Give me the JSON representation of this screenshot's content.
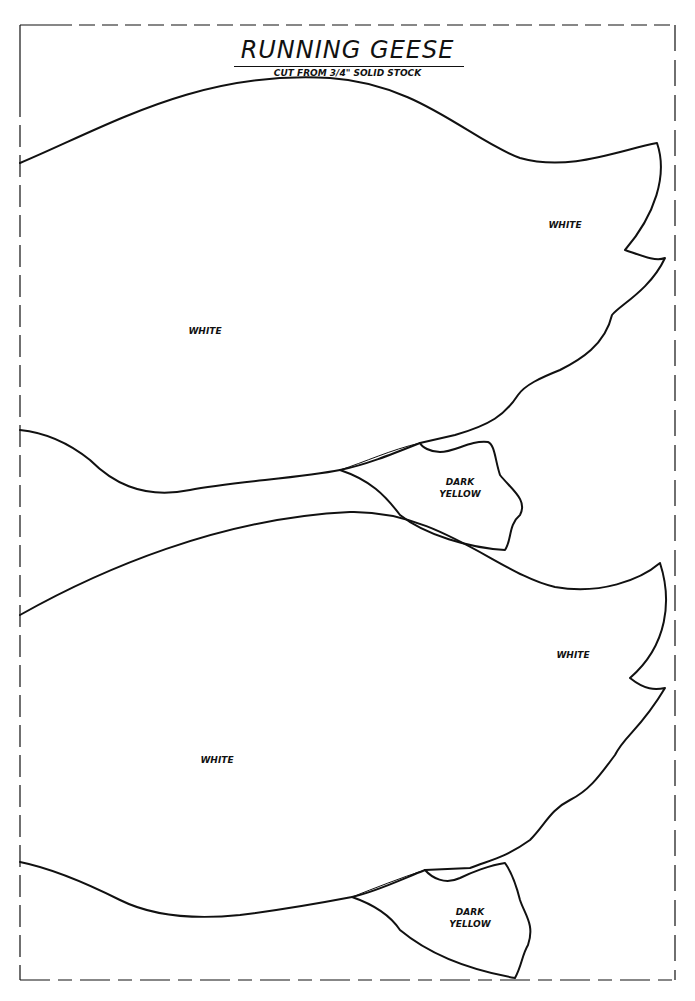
{
  "pattern": {
    "title": "RUNNING GEESE",
    "subtitle": "CUT FROM 3/4\" SOLID STOCK"
  },
  "geese": [
    {
      "body_label": "WHITE",
      "wing_label": "WHITE",
      "feet_label_line1": "DARK",
      "feet_label_line2": "YELLOW"
    },
    {
      "body_label": "WHITE",
      "wing_label": "WHITE",
      "feet_label_line1": "DARK",
      "feet_label_line2": "YELLOW"
    }
  ],
  "colors": {
    "line": "#111111",
    "paper": "#ffffff"
  }
}
